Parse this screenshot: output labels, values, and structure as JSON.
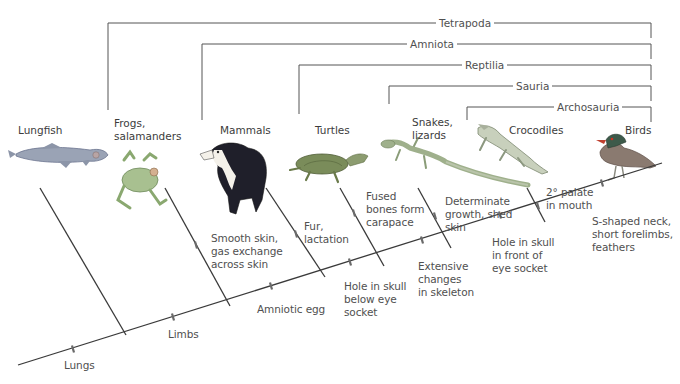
{
  "colors": {
    "line": "#3a3a3a",
    "bracket": "#555555",
    "tick": "#6a6a6a",
    "text": "#505050"
  },
  "clades": [
    {
      "name": "Tetrapoda",
      "y": 23,
      "left_x": 108,
      "right_x": 651,
      "label_x": 436
    },
    {
      "name": "Amniota",
      "y": 44,
      "left_x": 202,
      "right_x": 651,
      "label_x": 407
    },
    {
      "name": "Reptilia",
      "y": 65,
      "left_x": 299,
      "right_x": 651,
      "label_x": 462
    },
    {
      "name": "Sauria",
      "y": 86,
      "left_x": 389,
      "right_x": 651,
      "label_x": 513
    },
    {
      "name": "Archosauria",
      "y": 107,
      "left_x": 467,
      "right_x": 651,
      "label_x": 554
    }
  ],
  "taxa": [
    {
      "name": "Lungfish",
      "lines": [
        "Lungfish"
      ],
      "x": 18,
      "y": 124,
      "image": "lungfish"
    },
    {
      "name": "Frogs, salamanders",
      "lines": [
        "Frogs,",
        "salamanders"
      ],
      "x": 114,
      "y": 117,
      "image": "frog"
    },
    {
      "name": "Mammals",
      "lines": [
        "Mammals"
      ],
      "x": 220,
      "y": 124,
      "image": "dog"
    },
    {
      "name": "Turtles",
      "lines": [
        "Turtles"
      ],
      "x": 315,
      "y": 124,
      "image": "turtle"
    },
    {
      "name": "Snakes, lizards",
      "lines": [
        "Snakes,",
        "lizards"
      ],
      "x": 412,
      "y": 116,
      "image": "lizard"
    },
    {
      "name": "Crocodiles",
      "lines": [
        "Crocodiles"
      ],
      "x": 509,
      "y": 124,
      "image": "crocodile"
    },
    {
      "name": "Birds",
      "lines": [
        "Birds"
      ],
      "x": 625,
      "y": 124,
      "image": "duck"
    }
  ],
  "trunk": {
    "x1": 18,
    "y1": 365,
    "x2": 662,
    "y2": 163
  },
  "branches": [
    {
      "taxon": "Lungfish",
      "x1": 40,
      "y1": 188,
      "x2": 126,
      "y2": 335
    },
    {
      "taxon": "Frogs, salamanders",
      "x1": 165,
      "y1": 188,
      "x2": 230,
      "y2": 306
    },
    {
      "taxon": "Mammals",
      "x1": 266,
      "y1": 188,
      "x2": 325,
      "y2": 277
    },
    {
      "taxon": "Turtles",
      "x1": 340,
      "y1": 188,
      "x2": 384,
      "y2": 266
    },
    {
      "taxon": "Snakes, lizards",
      "x1": 418,
      "y1": 188,
      "x2": 451,
      "y2": 248
    },
    {
      "taxon": "Crocodiles",
      "x1": 527,
      "y1": 188,
      "x2": 545,
      "y2": 222
    }
  ],
  "characters": [
    {
      "text": [
        "Lungs"
      ],
      "tick_x": 73,
      "tick_y": 349,
      "label_x": 64,
      "label_y": 359
    },
    {
      "text": [
        "Limbs"
      ],
      "tick_x": 173,
      "tick_y": 317,
      "label_x": 168,
      "label_y": 328
    },
    {
      "text": [
        "Smooth skin,",
        "gas exchange",
        "across skin"
      ],
      "tick_x": 196,
      "tick_y": 245,
      "label_x": 211,
      "label_y": 232
    },
    {
      "text": [
        "Amniotic egg"
      ],
      "tick_x": 271,
      "tick_y": 286,
      "label_x": 257,
      "label_y": 303
    },
    {
      "text": [
        "Fur,",
        "lactation"
      ],
      "tick_x": 296,
      "tick_y": 234,
      "label_x": 304,
      "label_y": 220
    },
    {
      "text": [
        "Hole in skull",
        "below eye",
        "socket"
      ],
      "tick_x": 350,
      "tick_y": 262,
      "label_x": 344,
      "label_y": 280
    },
    {
      "text": [
        "Fused",
        "bones form",
        "carapace"
      ],
      "tick_x": 354,
      "tick_y": 213,
      "label_x": 366,
      "label_y": 190
    },
    {
      "text": [
        "Extensive",
        "changes",
        "in skeleton"
      ],
      "tick_x": 422,
      "tick_y": 240,
      "label_x": 418,
      "label_y": 260
    },
    {
      "text": [
        "Determinate",
        "growth, shed",
        "skin"
      ],
      "tick_x": 435,
      "tick_y": 216,
      "label_x": 445,
      "label_y": 195
    },
    {
      "text": [
        "Hole in skull",
        "in front of",
        "eye socket"
      ],
      "tick_x": 500,
      "tick_y": 215,
      "label_x": 492,
      "label_y": 236
    },
    {
      "text": [
        "2° palate",
        "in mouth"
      ],
      "tick_x": 538,
      "tick_y": 206,
      "label_x": 546,
      "label_y": 186
    },
    {
      "text": [
        "S-shaped neck,",
        "short forelimbs,",
        "feathers"
      ],
      "tick_x": 602,
      "tick_y": 183,
      "label_x": 592,
      "label_y": 215
    }
  ],
  "labels": {
    "lungs": "Lungs",
    "limbs": "Limbs",
    "smooth_skin": "Smooth skin, gas exchange across skin",
    "amniotic_egg": "Amniotic egg",
    "fur": "Fur, lactation",
    "hole_below": "Hole in skull below eye socket",
    "fused": "Fused bones form carapace",
    "extensive": "Extensive changes in skeleton",
    "determinate": "Determinate growth, shed skin",
    "hole_front": "Hole in skull in front of eye socket",
    "palate": "2° palate in mouth",
    "s_neck": "S-shaped neck, short forelimbs, feathers"
  }
}
